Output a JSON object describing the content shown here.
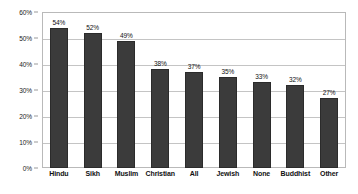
{
  "chart_data": {
    "type": "bar",
    "title": "",
    "subtitle": "",
    "xlabel": "",
    "ylabel": "",
    "categories": [
      "Hindu",
      "Sikh",
      "Muslim",
      "Christian",
      "All",
      "Jewish",
      "None",
      "Buddhist",
      "Other"
    ],
    "values": [
      54,
      52,
      49,
      38,
      37,
      35,
      33,
      32,
      27
    ],
    "value_labels": [
      "54%",
      "52%",
      "49%",
      "38%",
      "37%",
      "35%",
      "33%",
      "32%",
      "27%"
    ],
    "ylim": [
      0,
      60
    ],
    "y_ticks": [
      0,
      10,
      20,
      30,
      40,
      50,
      60
    ],
    "y_tick_labels": [
      "0%",
      "10%",
      "20%",
      "30%",
      "40%",
      "50%",
      "60%"
    ],
    "grid": true,
    "grid_axis": "y",
    "legend": false,
    "legend_position": "none",
    "bar_color": "#3b3b3b",
    "bar_edge_color": "#2b2b2b",
    "plot_border_color": "#b9b9b9",
    "gridline_color": "#c4c4c4",
    "background_color": "#ffffff",
    "text_color": "#111111"
  }
}
